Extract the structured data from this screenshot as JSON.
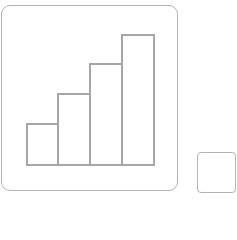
{
  "main_tile": {
    "icon": "bar-chart-icon",
    "stroke_color": "#a6a6a6",
    "border_color": "#b3b3b3"
  },
  "chart_data": {
    "type": "bar",
    "title": "",
    "categories": [
      "1",
      "2",
      "3",
      "4"
    ],
    "values": [
      1,
      2,
      3,
      4
    ],
    "xlabel": "",
    "ylabel": "",
    "grid": false,
    "legend": null
  },
  "bars": [
    {
      "left": 26,
      "top": 123,
      "width": 33,
      "height": 43
    },
    {
      "left": 57,
      "top": 93,
      "width": 34,
      "height": 73
    },
    {
      "left": 89,
      "top": 63,
      "width": 34,
      "height": 103
    },
    {
      "left": 121,
      "top": 34,
      "width": 34,
      "height": 132
    }
  ],
  "secondary_tile": {
    "icon": "empty-square-icon",
    "border_color": "#b3b3b3"
  }
}
